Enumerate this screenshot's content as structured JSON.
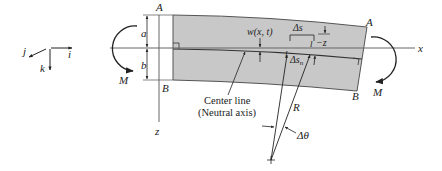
{
  "diagram": {
    "type": "beam-bending",
    "colors": {
      "beam_fill": "#c8c8c8",
      "line": "#333333",
      "axis": "#555555",
      "text": "#222222"
    },
    "coord_system": {
      "i_label": "i",
      "j_label": "j",
      "k_label": "k"
    },
    "axes": {
      "x_label": "x",
      "z_label": "z"
    },
    "corners": {
      "left_top": "A",
      "left_bottom": "B",
      "right_top": "A",
      "right_bottom": "B"
    },
    "dimensions": {
      "top": "a",
      "bottom": "b"
    },
    "moments": {
      "left": "M",
      "right": "M"
    },
    "annotations": {
      "deflection": "w(x, t)",
      "delta_s": "Δs",
      "delta_s_n": "Δs",
      "delta_s_n_sub": "n",
      "l_marker_top": "l",
      "l_marker_bottom": "l",
      "minus_z": "−z",
      "radius": "R",
      "delta_theta": "Δθ",
      "center_line": "Center line",
      "neutral_axis": "(Neutral axis)"
    }
  }
}
